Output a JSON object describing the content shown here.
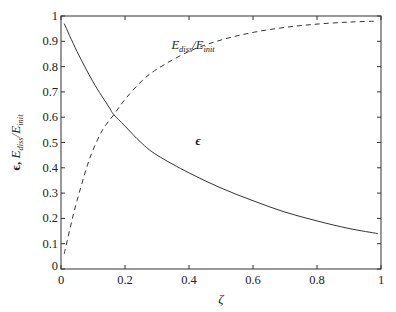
{
  "chart_data": {
    "type": "line",
    "title": "",
    "xlabel": "ζ",
    "ylabel": "ϵ, E_diss/E_init",
    "ylabel_parts": {
      "eps": "ϵ, ",
      "E1": "E",
      "sub1": "diss",
      "slash": "/",
      "E2": "E",
      "sub2": "init"
    },
    "xlim": [
      0,
      1
    ],
    "ylim": [
      0,
      1
    ],
    "grid": false,
    "legend": "none (inline annotations)",
    "xticks": [
      "0",
      "0.2",
      "0.4",
      "0.6",
      "0.8",
      "1"
    ],
    "xtick_values": [
      0,
      0.2,
      0.4,
      0.6,
      0.8,
      1
    ],
    "yticks": [
      "0",
      "0.1",
      "0.2",
      "0.3",
      "0.4",
      "0.5",
      "0.6",
      "0.7",
      "0.8",
      "0.9",
      "1"
    ],
    "ytick_values": [
      0,
      0.1,
      0.2,
      0.3,
      0.4,
      0.5,
      0.6,
      0.7,
      0.8,
      0.9,
      1
    ],
    "series": [
      {
        "name": "ϵ",
        "style": "solid",
        "x": [
          0.01,
          0.05,
          0.1,
          0.15,
          0.165,
          0.2,
          0.25,
          0.3,
          0.4,
          0.5,
          0.6,
          0.7,
          0.8,
          0.9,
          0.99
        ],
        "values": [
          0.97,
          0.86,
          0.74,
          0.64,
          0.61,
          0.565,
          0.5,
          0.45,
          0.38,
          0.32,
          0.27,
          0.225,
          0.19,
          0.16,
          0.14
        ]
      },
      {
        "name": "E_diss/E_init",
        "style": "dashed",
        "x": [
          0.01,
          0.03,
          0.05,
          0.08,
          0.1,
          0.13,
          0.165,
          0.2,
          0.25,
          0.3,
          0.4,
          0.5,
          0.6,
          0.7,
          0.8,
          0.9,
          0.99
        ],
        "values": [
          0.06,
          0.17,
          0.27,
          0.4,
          0.47,
          0.55,
          0.61,
          0.67,
          0.74,
          0.79,
          0.86,
          0.905,
          0.935,
          0.955,
          0.968,
          0.976,
          0.98
        ]
      }
    ],
    "annotations": [
      {
        "text_main": "E",
        "sub1": "diss",
        "slash": "/",
        "text_main2": "E",
        "sub2": "init",
        "x": 0.345,
        "y": 0.87
      },
      {
        "text": "ϵ",
        "x": 0.42,
        "y": 0.49
      }
    ]
  }
}
